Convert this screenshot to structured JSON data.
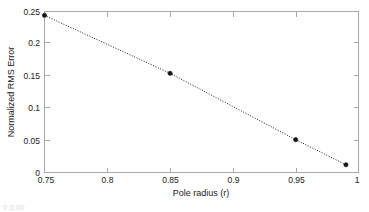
{
  "chart_data": {
    "type": "line",
    "title": "",
    "xlabel": "Pole radius (r)",
    "ylabel": "Normalized RMS Error",
    "xlim": [
      0.75,
      1
    ],
    "ylim": [
      0,
      0.25
    ],
    "xticks": [
      0.75,
      0.8,
      0.85,
      0.9,
      0.95,
      1
    ],
    "xticklabels": [
      "0.75",
      "0.8",
      "0.85",
      "0.9",
      "0.95",
      "1"
    ],
    "yticks": [
      0,
      0.05,
      0.1,
      0.15,
      0.2,
      0.25
    ],
    "yticklabels": [
      "0",
      "0.05",
      "0.1",
      "0.15",
      "0.2",
      "0.25"
    ],
    "grid": false,
    "legend": null,
    "line_style": "dotted",
    "marker": "filled-circle",
    "line_color": "#1c1c1c",
    "marker_color": "#161616",
    "axis_color": "#a8a8a8",
    "background": "#ffffff",
    "series": [
      {
        "name": "Normalized RMS Error",
        "x": [
          0.75,
          0.85,
          0.95,
          0.99
        ],
        "y": [
          0.244,
          0.154,
          0.051,
          0.012
        ]
      }
    ]
  },
  "figure": {
    "bottom_artifact_text": "0.0.00"
  }
}
